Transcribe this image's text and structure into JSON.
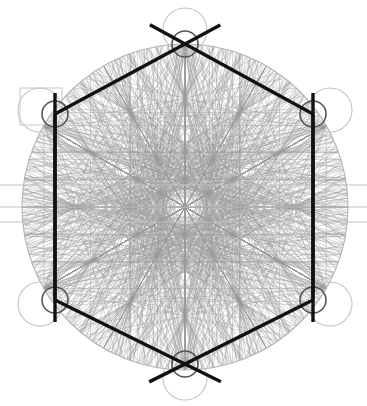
{
  "document": {
    "title": "Hexagonal Sacred-Geometry Construction Diagram",
    "background_color": "#ffffff",
    "width": 367,
    "height": 406
  },
  "palette": {
    "heavy_stroke": "#111111",
    "mid_stroke": "#555555",
    "faint_stroke": "#9a9a9a",
    "very_faint_stroke": "#c2c2c2",
    "rect_stroke": "#c8c8c8",
    "background": "#ffffff"
  },
  "chart_data": {
    "type": "diagram",
    "subtype": "compass-and-straightedge hexagon construction",
    "center": {
      "x": 185,
      "y": 207
    },
    "circumradius": 163,
    "hexagon": {
      "label": "primary hexagon",
      "orientation": "pointy-top",
      "stroke_color": "#111111",
      "stroke_width": 3.4,
      "vertices": [
        {
          "name": "top",
          "x": 185,
          "y": 44
        },
        {
          "name": "upper-right",
          "x": 313,
          "y": 114
        },
        {
          "name": "lower-right",
          "x": 313,
          "y": 300
        },
        {
          "name": "bottom",
          "x": 185,
          "y": 364
        },
        {
          "name": "lower-left",
          "x": 55,
          "y": 300
        },
        {
          "name": "upper-left",
          "x": 55,
          "y": 114
        }
      ]
    },
    "overshoot_lines": {
      "description": "heavy hexagon edges extend past the top and bottom vertices forming X crossings",
      "extension_px": 40,
      "stroke_color": "#111111",
      "stroke_width": 3.4
    },
    "vertical_heavy_lines": [
      {
        "name": "left-vertical",
        "x": 55,
        "y1": 93,
        "y2": 322
      },
      {
        "name": "right-vertical",
        "x": 313,
        "y1": 93,
        "y2": 322
      }
    ],
    "vertex_circles": {
      "description": "small mid-gray circle centred on each hexagon vertex",
      "radius": 13,
      "stroke_color": "#555555",
      "stroke_width": 1.6
    },
    "outer_vertex_circles": {
      "description": "large faint circles tangent outside the top, bottom and side vertices",
      "radius": 22,
      "stroke_color": "#c2c2c2",
      "stroke_width": 1.1,
      "centers": [
        {
          "x": 185,
          "y": 30
        },
        {
          "x": 185,
          "y": 378
        },
        {
          "x": 40,
          "y": 110
        },
        {
          "x": 330,
          "y": 110
        },
        {
          "x": 40,
          "y": 304
        },
        {
          "x": 330,
          "y": 304
        }
      ]
    },
    "bounding_circle": {
      "name": "circumscribed circle",
      "cx": 185,
      "cy": 207,
      "r": 163,
      "stroke_color": "#b4b4b4",
      "stroke_width": 1.1
    },
    "construction_rectangle": {
      "name": "upper-left guide rectangle",
      "x": 20,
      "y": 88,
      "width": 42,
      "height": 37,
      "stroke_color": "#c8c8c8",
      "stroke_width": 1
    },
    "horizontal_guides": [
      {
        "name": "upper-guide",
        "y": 185
      },
      {
        "name": "center-guide",
        "y": 207
      },
      {
        "name": "lower-guide",
        "y": 222
      }
    ],
    "construction_network": {
      "description": "dense faint web of chords joining every pair of construction nodes",
      "stroke_color": "#9a9a9a",
      "stroke_width": 0.55,
      "node_rings": [
        {
          "name": "outer-hex",
          "radius": 163,
          "count": 6,
          "phase_deg": -90
        },
        {
          "name": "mid-hex",
          "radius": 109,
          "count": 6,
          "phase_deg": -90
        },
        {
          "name": "mid-hex-b",
          "radius": 109,
          "count": 6,
          "phase_deg": -60
        },
        {
          "name": "inner-hex",
          "radius": 55,
          "count": 6,
          "phase_deg": -90
        },
        {
          "name": "inner-hex-b",
          "radius": 55,
          "count": 6,
          "phase_deg": -60
        },
        {
          "name": "core-hex",
          "radius": 28,
          "count": 6,
          "phase_deg": -90
        }
      ]
    },
    "symmetry": {
      "order": 6,
      "type": "D6 dihedral",
      "mirror_axes": 6
    }
  }
}
